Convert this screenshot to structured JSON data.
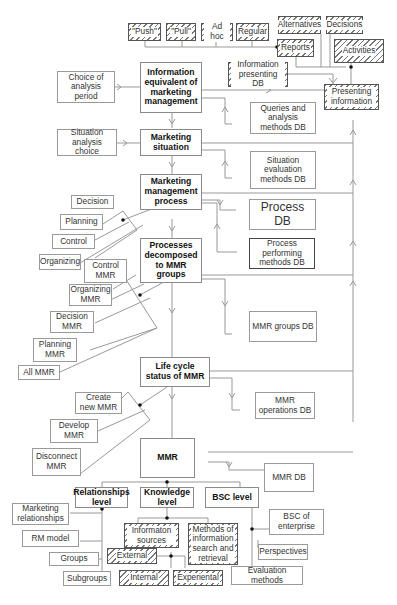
{
  "diagram": {
    "top_row": {
      "push": "\"Push\"",
      "pull": "\"Pull\"",
      "adhoc": "Ad hoc",
      "regular": "Regular",
      "alternatives": "Alternatives",
      "decisions": "Decisions",
      "reports": "Reports",
      "activities": "Activities",
      "info_presenting_db": "Information presenting DB",
      "presenting_info": "Presenting information"
    },
    "main_chain": {
      "info_equivalent": "Information equivalent of marketing management",
      "marketing_situation": "Marketing situation",
      "mm_process": "Marketing management process",
      "processes_decomposed": "Processes decomposed to MMR groups",
      "life_cycle": "Life cycle status of MMR",
      "mmr": "MMR"
    },
    "left_inputs": {
      "choice_period": "Choice of analysis period",
      "situation_choice": "Situation analysis choice",
      "decision": "Decision",
      "planning": "Planning",
      "control": "Control",
      "organizing": "Organizing",
      "control_mmr": "Control MMR",
      "organizing_mmr": "Organizing MMR",
      "decision_mmr": "Decision MMR",
      "planning_mmr": "Planning MMR",
      "all_mmr": "All MMR",
      "create_mmr": "Create new MMR",
      "develop_mmr": "Develop MMR",
      "disconnect_mmr": "Disconnect MMR"
    },
    "databases": {
      "queries_db": "Queries and analysis methods DB",
      "situation_db": "Situation evaluation methods DB",
      "process_db": "Process DB",
      "process_methods_db": "Process performing methods DB",
      "mmr_groups_db": "MMR groups DB",
      "mmr_operations_db": "MMR operations DB",
      "mmr_db": "MMR DB"
    },
    "levels": {
      "relationships": "Relationships level",
      "knowledge": "Knowledge level",
      "bsc": "BSC level"
    },
    "relationships_children": {
      "marketing_relationships": "Marketing relationships",
      "rm_model": "RM model",
      "groups": "Groups",
      "subgroups": "Subgroups"
    },
    "knowledge_children": {
      "info_sources": "Informaton sources",
      "methods_search": "Methods of information search and retrieval",
      "external": "External",
      "internal": "Internal",
      "experiential": "Experiental"
    },
    "bsc_children": {
      "bsc_enterprise": "BSC of enterprise",
      "perspectives": "Perspectives",
      "evaluation_methods": "Evaluation methods"
    }
  }
}
